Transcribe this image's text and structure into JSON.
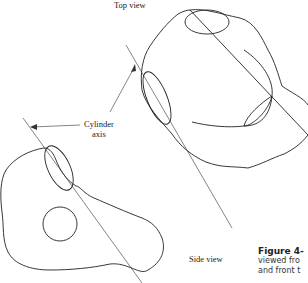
{
  "figure": {
    "labels": {
      "top_view": "Top view",
      "cylinder": "Cylinder",
      "axis": "axis",
      "side_view": "Side view"
    },
    "caption": {
      "title": "Figure 4-",
      "line1": "viewed fro",
      "line2": "and front t"
    }
  }
}
